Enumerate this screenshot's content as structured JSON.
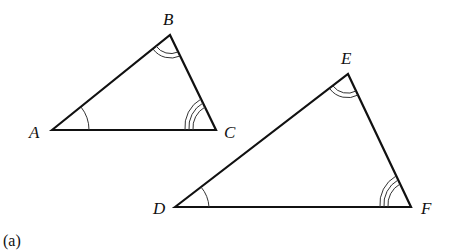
{
  "figure": {
    "caption": "(a)",
    "triangles": [
      {
        "name": "ABC",
        "vertices": [
          {
            "label": "A",
            "x": 52,
            "y": 130,
            "angle_marks": 1
          },
          {
            "label": "B",
            "x": 170,
            "y": 35,
            "angle_marks": 2
          },
          {
            "label": "C",
            "x": 216,
            "y": 130,
            "angle_marks": 3
          }
        ]
      },
      {
        "name": "DEF",
        "vertices": [
          {
            "label": "D",
            "x": 175,
            "y": 207,
            "angle_marks": 1
          },
          {
            "label": "E",
            "x": 348,
            "y": 74,
            "angle_marks": 2
          },
          {
            "label": "F",
            "x": 411,
            "y": 207,
            "angle_marks": 3
          }
        ]
      }
    ],
    "relation": "Triangle ABC is similar to triangle DEF (corresponding angles marked equal)"
  }
}
